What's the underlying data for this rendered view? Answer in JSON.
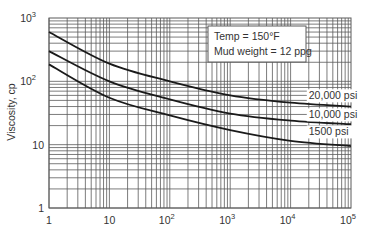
{
  "chart_data": {
    "type": "line",
    "title": "",
    "xlabel": "",
    "ylabel": "Viscosity, cp",
    "xscale": "log",
    "yscale": "log",
    "xlim": [
      1,
      100000
    ],
    "ylim": [
      1,
      1000
    ],
    "grid": true,
    "x_tick_labels": [
      {
        "value": 1,
        "base": "1",
        "exp": ""
      },
      {
        "value": 10,
        "base": "10",
        "exp": ""
      },
      {
        "value": 100,
        "base": "10",
        "exp": "2"
      },
      {
        "value": 1000,
        "base": "10",
        "exp": "3"
      },
      {
        "value": 10000,
        "base": "10",
        "exp": "4"
      },
      {
        "value": 100000,
        "base": "10",
        "exp": "5"
      }
    ],
    "y_tick_labels": [
      {
        "value": 1,
        "base": "1",
        "exp": ""
      },
      {
        "value": 10,
        "base": "10",
        "exp": ""
      },
      {
        "value": 100,
        "base": "10",
        "exp": "2"
      },
      {
        "value": 1000,
        "base": "10",
        "exp": "3"
      }
    ],
    "x": [
      1,
      10,
      100,
      1000,
      10000,
      100000
    ],
    "series": [
      {
        "name": "20,000 psi",
        "values": [
          600,
          190,
          100,
          60,
          46,
          40
        ]
      },
      {
        "name": "10,000 psi",
        "values": [
          300,
          100,
          52,
          31,
          24,
          21
        ]
      },
      {
        "name": "1500 psi",
        "values": [
          185,
          55,
          29,
          17,
          11.5,
          9.5
        ]
      }
    ],
    "series_labels": [
      {
        "text": "20,000 psi",
        "x": 20000,
        "y": 52
      },
      {
        "text": "10,000 psi",
        "x": 20000,
        "y": 26
      },
      {
        "text": "1500 psi",
        "x": 20000,
        "y": 14
      }
    ],
    "annotation": {
      "lines": [
        "Temp = 150°F",
        "Mud weight = 12 ppg"
      ]
    }
  },
  "style": {
    "grid_color": "#5a5a5a",
    "curve_color": "#1a1a1a",
    "text_color": "#333333"
  }
}
